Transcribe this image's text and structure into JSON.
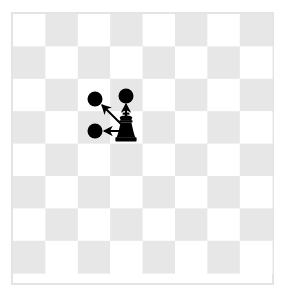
{
  "scene": {
    "title": "Chess king move diagram",
    "description": "A chessboard showing a black king and arrows to three legal destination squares"
  },
  "board": {
    "columns": 8,
    "rows": 8,
    "origin_x": 13,
    "origin_y": 14,
    "square_size": 32.4,
    "light_color": "#ffffff",
    "dark_color": "#e7e7e7",
    "border_color": "#e4e4e4",
    "border_width": 2,
    "light_square_first": true
  },
  "pieces": [
    {
      "name": "black-king",
      "type": "king",
      "color": "#000000",
      "col": 3,
      "row": 3,
      "center_x": 126,
      "center_y": 130
    }
  ],
  "markers": [
    {
      "name": "move-target-dot-up",
      "col": 3,
      "row": 2,
      "center_x": 126,
      "center_y": 96,
      "radius": 7.5,
      "color": "#000000"
    },
    {
      "name": "move-target-dot-up-left",
      "col": 2,
      "row": 2,
      "center_x": 95,
      "center_y": 99,
      "radius": 7.5,
      "color": "#000000"
    },
    {
      "name": "move-target-dot-left",
      "col": 2,
      "row": 3,
      "center_x": 95,
      "center_y": 131,
      "radius": 7.5,
      "color": "#000000"
    }
  ],
  "arrows": [
    {
      "name": "arrow-up",
      "from_x": 126,
      "from_y": 120,
      "to_x": 126,
      "to_y": 104,
      "color": "#000000",
      "stroke_width": 2
    },
    {
      "name": "arrow-up-left",
      "from_x": 121,
      "from_y": 124,
      "to_x": 102,
      "to_y": 105,
      "color": "#000000",
      "stroke_width": 2
    },
    {
      "name": "arrow-left",
      "from_x": 119,
      "from_y": 131,
      "to_x": 104,
      "to_y": 131,
      "color": "#000000",
      "stroke_width": 2
    }
  ]
}
